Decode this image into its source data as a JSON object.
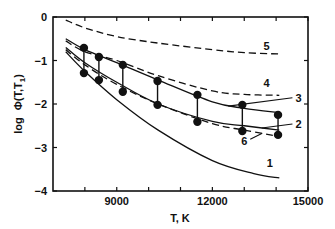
{
  "chart_data": {
    "type": "line",
    "title": "",
    "xlabel": "T, K",
    "ylabel": "log Φ(T,T₁)",
    "xlim": [
      7000,
      15000
    ],
    "ylim": [
      -4,
      0
    ],
    "x_ticks": [
      9000,
      12000,
      15000
    ],
    "x_minor_ticks": [
      8000,
      10000,
      11000,
      13000,
      14000
    ],
    "y_ticks": [
      0,
      -1,
      -2,
      -3,
      -4
    ],
    "y_tick_labels": [
      "0",
      "−1",
      "−2",
      "−3",
      "−4"
    ],
    "grid": false,
    "legend": "inline curve numbers",
    "series": [
      {
        "name": "1",
        "style": "solid",
        "x": [
          7400,
          8000,
          9000,
          10300,
          12000,
          13300,
          14100
        ],
        "values": [
          -0.8,
          -1.25,
          -1.9,
          -2.6,
          -3.3,
          -3.6,
          -3.7
        ],
        "label_pos": [
          13800,
          -3.45
        ]
      },
      {
        "name": "2",
        "style": "solid",
        "x": [
          7400,
          8000,
          9000,
          10300,
          12000,
          13000,
          14100
        ],
        "values": [
          -0.7,
          -1.05,
          -1.5,
          -2.0,
          -2.4,
          -2.5,
          -2.6
        ],
        "label_pos": [
          14700,
          -2.55
        ]
      },
      {
        "name": "3",
        "style": "solid",
        "x": [
          7400,
          8000,
          9000,
          10300,
          12000,
          13000,
          14100
        ],
        "values": [
          -0.5,
          -0.75,
          -1.05,
          -1.45,
          -1.95,
          -2.1,
          -2.2
        ],
        "label_pos": [
          14700,
          -1.95
        ]
      },
      {
        "name": "4",
        "style": "dashed",
        "x": [
          7400,
          8000,
          9000,
          10300,
          12000,
          13000,
          14100
        ],
        "values": [
          -0.55,
          -0.8,
          -1.0,
          -1.35,
          -1.7,
          -1.78,
          -1.8
        ],
        "label_pos": [
          13700,
          -1.6
        ]
      },
      {
        "name": "5",
        "style": "dashed",
        "x": [
          7400,
          8000,
          9000,
          10300,
          12000,
          13000,
          14100
        ],
        "values": [
          -0.07,
          -0.25,
          -0.45,
          -0.6,
          -0.75,
          -0.82,
          -0.85
        ],
        "label_pos": [
          13700,
          -0.77
        ]
      },
      {
        "name": "6",
        "style": "dashed",
        "x": [
          7400,
          8000,
          9000,
          10300,
          12000,
          13000,
          14100
        ],
        "values": [
          -0.75,
          -1.1,
          -1.55,
          -2.0,
          -2.45,
          -2.6,
          -2.75
        ],
        "label_pos": [
          13000,
          -2.95
        ]
      }
    ],
    "error_bars": {
      "x": [
        7970,
        8440,
        9190,
        10280,
        11530,
        12940,
        14060
      ],
      "upper": [
        -0.71,
        -0.92,
        -1.1,
        -1.47,
        -1.79,
        -2.02,
        -2.25
      ],
      "lower": [
        -1.29,
        -1.45,
        -1.72,
        -2.02,
        -2.41,
        -2.62,
        -2.71
      ]
    }
  },
  "axes": {
    "x_label": "T, K",
    "y_label_prefix": "log",
    "y_label_func": "Φ(T,T",
    "y_label_sub": "1",
    "y_label_suffix": ")"
  }
}
